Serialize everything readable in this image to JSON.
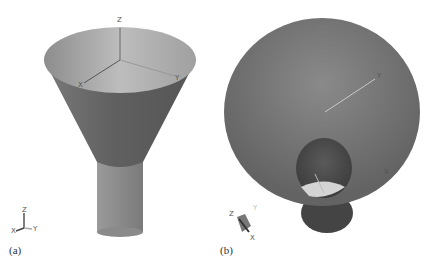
{
  "figure": {
    "panels": [
      {
        "caption": "(a)",
        "view": "side view of funnel with cylindrical stem",
        "axes_main": {
          "z": "Z",
          "x": "X",
          "y": "Y"
        },
        "triad": {
          "z": "Z",
          "x": "X",
          "y": "Y"
        }
      },
      {
        "caption": "(b)",
        "view": "top view of funnel looking into the throat",
        "axes_main": {
          "y": "Y",
          "x": "X"
        },
        "triad": {
          "z": "Z",
          "x": "X",
          "y": "Y"
        }
      }
    ],
    "colors": {
      "background": "#ffffff",
      "cone_outer": "#6b6b6b",
      "cone_inner": "#a8a8a8",
      "stem": "#8e8e8e",
      "axis_line": "#777777"
    }
  }
}
